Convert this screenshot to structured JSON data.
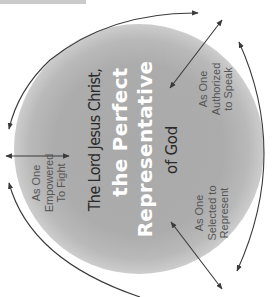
{
  "diagram": {
    "center": {
      "line1": "The Lord Jesus Christ,",
      "line2": "the Perfect",
      "line3": "Representative",
      "line4": "of God"
    },
    "roles": [
      {
        "id": "fight",
        "lines": [
          "As One",
          "Empowered",
          "To Fight"
        ]
      },
      {
        "id": "speak",
        "lines": [
          "As One",
          "Authorized",
          "to Speak"
        ]
      },
      {
        "id": "represent",
        "lines": [
          "As One",
          "Selected to",
          "Represent"
        ]
      }
    ],
    "colors": {
      "circle": "#a9a9a9",
      "arrow": "#3a3a3a",
      "title_white": "#ffffff",
      "title_dark": "#2a2a2a",
      "label": "#555555",
      "top_bar": "#cacaca"
    }
  }
}
